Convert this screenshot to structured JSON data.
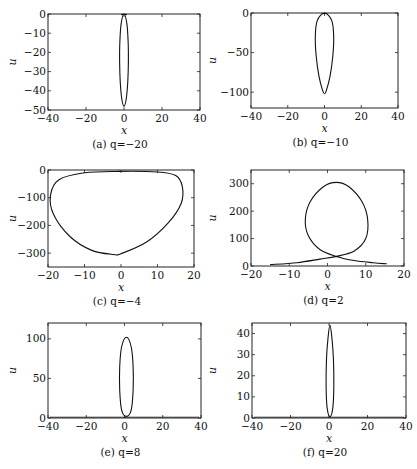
{
  "figure": {
    "panels": [
      {
        "id": "a",
        "caption": "(a) q=−20",
        "q": -20
      },
      {
        "id": "b",
        "caption": "(b) q=−10",
        "q": -10
      },
      {
        "id": "c",
        "caption": "(c) q=−4",
        "q": -4
      },
      {
        "id": "d",
        "caption": "(d) q=2",
        "q": 2
      },
      {
        "id": "e",
        "caption": "(e) q=8",
        "q": 8
      },
      {
        "id": "f",
        "caption": "(f) q=20",
        "q": 20
      }
    ]
  },
  "chart_data": [
    {
      "panel": "a",
      "type": "line",
      "title": "(a) q=−20",
      "xlabel": "x",
      "ylabel": "u",
      "xlim": [
        -40,
        40
      ],
      "ylim": [
        -50,
        0
      ],
      "xticks": [
        -40,
        -20,
        0,
        20,
        40
      ],
      "yticks": [
        0,
        -10,
        -20,
        -30,
        -40,
        -50
      ],
      "xtick_labels": [
        "−40",
        "−20",
        "0",
        "20",
        "40"
      ],
      "ytick_labels": [
        "0",
        "−10",
        "−20",
        "−30",
        "−40",
        "−50"
      ],
      "grid": false,
      "description": "Narrow closed loop centered at x≈0 from u≈0 down to u≈−48, max half-width ≈2",
      "series": [
        {
          "name": "orbit",
          "x": [
            0,
            1.5,
            2.2,
            2.3,
            2,
            1.2,
            0,
            -1.2,
            -2,
            -2.3,
            -2.2,
            -1.5,
            0
          ],
          "y": [
            0,
            -5,
            -15,
            -25,
            -35,
            -44,
            -48,
            -44,
            -35,
            -25,
            -15,
            -5,
            0
          ]
        }
      ]
    },
    {
      "panel": "b",
      "type": "line",
      "title": "(b) q=−10",
      "xlabel": "x",
      "ylabel": "u",
      "xlim": [
        -40,
        40
      ],
      "ylim": [
        -120,
        0
      ],
      "xticks": [
        -40,
        -20,
        0,
        20,
        40
      ],
      "yticks": [
        0,
        -50,
        -100
      ],
      "xtick_labels": [
        "−40",
        "−20",
        "0",
        "20",
        "40"
      ],
      "ytick_labels": [
        "0",
        "−50",
        "−100"
      ],
      "grid": false,
      "description": "Teardrop loop centered at x≈0, from u≈0 to u≈−102, max half-width ≈5",
      "series": [
        {
          "name": "orbit",
          "x": [
            0,
            4,
            5,
            4.5,
            3,
            1,
            0,
            -1,
            -3,
            -4.5,
            -5,
            -4,
            0
          ],
          "y": [
            0,
            -10,
            -30,
            -55,
            -80,
            -98,
            -102,
            -98,
            -80,
            -55,
            -30,
            -10,
            0
          ]
        }
      ]
    },
    {
      "panel": "c",
      "type": "line",
      "title": "(c) q=−4",
      "xlabel": "x",
      "ylabel": "u",
      "xlim": [
        -20,
        20
      ],
      "ylim": [
        -350,
        0
      ],
      "xticks": [
        -20,
        -10,
        0,
        10,
        20
      ],
      "yticks": [
        0,
        -100,
        -200,
        -300
      ],
      "xtick_labels": [
        "−20",
        "−10",
        "0",
        "10",
        "20"
      ],
      "ytick_labels": [
        "0",
        "−100",
        "−200",
        "−300"
      ],
      "grid": false,
      "description": "Wide asymmetric closed loop, x from ≈−19 to ≈17, u from ≈−5 to ≈−305",
      "series": [
        {
          "name": "orbit",
          "x": [
            -1,
            10,
            15,
            16.8,
            16.5,
            13,
            7,
            0,
            -2,
            -8,
            -14,
            -18.5,
            -19.3,
            -17,
            -10,
            -1
          ],
          "y": [
            -5,
            -7,
            -20,
            -60,
            -120,
            -190,
            -260,
            -302,
            -305,
            -290,
            -240,
            -160,
            -90,
            -35,
            -10,
            -5
          ]
        }
      ]
    },
    {
      "panel": "d",
      "type": "line",
      "title": "(d) q=2",
      "xlabel": "x",
      "ylabel": "u",
      "xlim": [
        -20,
        20
      ],
      "ylim": [
        0,
        350
      ],
      "xticks": [
        -20,
        -10,
        0,
        10,
        20
      ],
      "yticks": [
        0,
        100,
        200,
        300
      ],
      "xtick_labels": [
        "−20",
        "−10",
        "0",
        "10",
        "20"
      ],
      "ytick_labels": [
        "0",
        "100",
        "200",
        "300"
      ],
      "grid": false,
      "description": "Open self-intersecting loop: tails from (−15,5) and (15.5,8) crossing near (2.3,35), loop peaking at u≈305 at x≈2.3, x-range of loop ≈−5.8 to ≈10.5",
      "series": [
        {
          "name": "orbit",
          "x": [
            -15,
            -8,
            -2,
            2.3,
            7,
            10,
            10.5,
            9,
            5.5,
            2.3,
            -1,
            -4.5,
            -5.8,
            -5,
            -2,
            2.3,
            7,
            12,
            15.5
          ],
          "y": [
            5,
            12,
            25,
            35,
            55,
            100,
            170,
            235,
            290,
            305,
            290,
            235,
            170,
            110,
            60,
            35,
            20,
            12,
            8
          ]
        }
      ]
    },
    {
      "panel": "e",
      "type": "line",
      "title": "(e) q=8",
      "xlabel": "x",
      "ylabel": "u",
      "xlim": [
        -40,
        40
      ],
      "ylim": [
        0,
        120
      ],
      "xticks": [
        -40,
        -20,
        0,
        20,
        40
      ],
      "yticks": [
        0,
        50,
        100
      ],
      "xtick_labels": [
        "−40",
        "−20",
        "0",
        "20",
        "40"
      ],
      "ytick_labels": [
        "0",
        "50",
        "100"
      ],
      "grid": false,
      "description": "Narrow closed loop centered at x≈1, u from ≈2 to ≈102, max half-width ≈4; flat tails along u≈0",
      "series": [
        {
          "name": "orbit",
          "x": [
            1,
            3.5,
            4.5,
            4.5,
            3.5,
            1,
            -1.5,
            -2.5,
            -2.5,
            -1.5,
            1
          ],
          "y": [
            2,
            10,
            35,
            65,
            90,
            102,
            90,
            65,
            35,
            10,
            2
          ]
        }
      ]
    },
    {
      "panel": "f",
      "type": "line",
      "title": "(f) q=20",
      "xlabel": "x",
      "ylabel": "u",
      "xlim": [
        -40,
        40
      ],
      "ylim": [
        0,
        45
      ],
      "xticks": [
        -40,
        -20,
        0,
        20,
        40
      ],
      "yticks": [
        0,
        10,
        20,
        30,
        40
      ],
      "xtick_labels": [
        "−40",
        "−20",
        "0",
        "20",
        "40"
      ],
      "ytick_labels": [
        "0",
        "10",
        "20",
        "30",
        "40"
      ],
      "grid": false,
      "description": "Very narrow closed loop centered at x≈0.5, u from ≈0.5 to ≈44, max half-width ≈2; tails along u≈0",
      "series": [
        {
          "name": "orbit",
          "x": [
            0.5,
            2,
            2.5,
            2.3,
            1.5,
            0.5,
            -0.5,
            -1.3,
            -1.5,
            -1,
            0.5
          ],
          "y": [
            0.5,
            5,
            15,
            28,
            38,
            44,
            38,
            28,
            15,
            5,
            0.5
          ]
        }
      ]
    }
  ]
}
